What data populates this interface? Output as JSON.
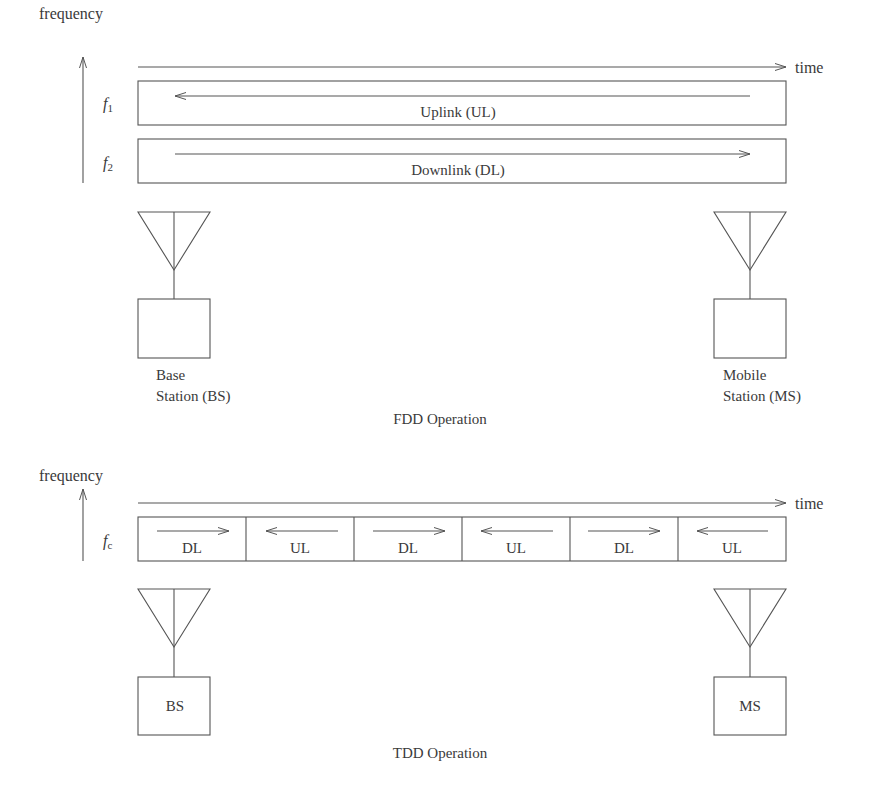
{
  "fdd": {
    "axis": {
      "y_label": "frequency",
      "x_label": "time"
    },
    "bands": [
      {
        "freq_symbol": "f",
        "freq_sub": "1",
        "label": "Uplink (UL)",
        "direction": "left"
      },
      {
        "freq_symbol": "f",
        "freq_sub": "2",
        "label": "Downlink (DL)",
        "direction": "right"
      }
    ],
    "base_station": {
      "line1": "Base",
      "line2": "Station (BS)",
      "box_label": ""
    },
    "mobile_station": {
      "line1": "Mobile",
      "line2": "Station (MS)",
      "box_label": ""
    },
    "caption": "FDD Operation"
  },
  "tdd": {
    "axis": {
      "y_label": "frequency",
      "x_label": "time"
    },
    "carrier": {
      "freq_symbol": "f",
      "freq_sub": "c"
    },
    "slots": [
      {
        "label": "DL",
        "direction": "right"
      },
      {
        "label": "UL",
        "direction": "left"
      },
      {
        "label": "DL",
        "direction": "right"
      },
      {
        "label": "UL",
        "direction": "left"
      },
      {
        "label": "DL",
        "direction": "right"
      },
      {
        "label": "UL",
        "direction": "left"
      }
    ],
    "base_station": {
      "box_label": "BS"
    },
    "mobile_station": {
      "box_label": "MS"
    },
    "caption": "TDD Operation"
  },
  "colors": {
    "stroke": "#555555",
    "text": "#3a3a3a",
    "background": "#ffffff"
  }
}
